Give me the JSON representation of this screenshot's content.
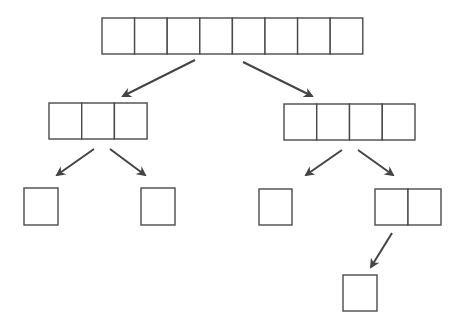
{
  "diagram": {
    "type": "array-split-tree",
    "stroke_color": "#4a4a4a",
    "arrow_color": "#444444",
    "background": "#ffffff",
    "nodes": [
      {
        "id": "root",
        "cells": 8,
        "x": 102,
        "y": 18,
        "cell_w": 32.6,
        "h": 36
      },
      {
        "id": "left",
        "cells": 3,
        "x": 49,
        "y": 103,
        "cell_w": 32.7,
        "h": 36
      },
      {
        "id": "right",
        "cells": 4,
        "x": 284,
        "y": 104,
        "cell_w": 32.75,
        "h": 36
      },
      {
        "id": "left-left",
        "cells": 1,
        "x": 24,
        "y": 188,
        "cell_w": 34,
        "h": 37
      },
      {
        "id": "left-right",
        "cells": 1,
        "x": 141,
        "y": 188,
        "cell_w": 34,
        "h": 37
      },
      {
        "id": "right-left",
        "cells": 1,
        "x": 259,
        "y": 189,
        "cell_w": 33,
        "h": 36
      },
      {
        "id": "right-right",
        "cells": 2,
        "x": 375,
        "y": 189,
        "cell_w": 33,
        "h": 36
      },
      {
        "id": "right-right-left",
        "cells": 1,
        "x": 343,
        "y": 275,
        "cell_w": 34,
        "h": 36
      }
    ],
    "arrows": [
      {
        "from": "root",
        "to": "left",
        "x1": 195,
        "y1": 60,
        "x2": 123,
        "y2": 96
      },
      {
        "from": "root",
        "to": "right",
        "x1": 243,
        "y1": 62,
        "x2": 312,
        "y2": 96
      },
      {
        "from": "left",
        "to": "left-left",
        "x1": 94,
        "y1": 149,
        "x2": 57,
        "y2": 175
      },
      {
        "from": "left",
        "to": "left-right",
        "x1": 110,
        "y1": 149,
        "x2": 145,
        "y2": 175
      },
      {
        "from": "right",
        "to": "right-left",
        "x1": 342,
        "y1": 150,
        "x2": 306,
        "y2": 175
      },
      {
        "from": "right",
        "to": "right-right",
        "x1": 358,
        "y1": 150,
        "x2": 393,
        "y2": 175
      },
      {
        "from": "right-right",
        "to": "right-right-left",
        "x1": 392,
        "y1": 233,
        "x2": 371,
        "y2": 267
      }
    ]
  }
}
